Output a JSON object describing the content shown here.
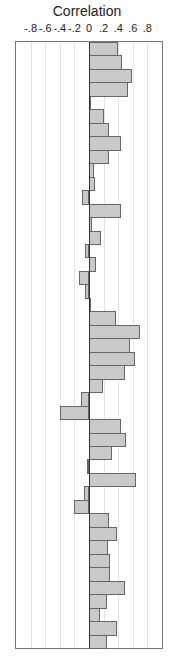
{
  "chart_data": {
    "type": "bar",
    "orientation": "horizontal",
    "title": "Correlation",
    "xlabel": "Correlation",
    "ylabel": "",
    "xlim": [
      -1.0,
      1.0
    ],
    "tick_labels": [
      "-.8",
      "-.6",
      "-.4",
      "-.2",
      "0",
      ".2",
      ".4",
      ".6",
      ".8"
    ],
    "tick_values": [
      -0.8,
      -0.6,
      -0.4,
      -0.2,
      0,
      0.2,
      0.4,
      0.6,
      0.8
    ],
    "grid": true,
    "legend": null,
    "bar_color": "#c9c9c9",
    "bar_edge_color": "#666666",
    "categories": [
      "1",
      "2",
      "3",
      "4",
      "5",
      "6",
      "7",
      "8",
      "9",
      "10",
      "11",
      "12",
      "13",
      "14",
      "15",
      "16",
      "17",
      "18",
      "19",
      "20",
      "21",
      "22",
      "23",
      "24",
      "25",
      "26",
      "27",
      "28",
      "29",
      "30",
      "31",
      "32",
      "33",
      "34",
      "35",
      "36",
      "37",
      "38",
      "39",
      "40",
      "41",
      "42",
      "43",
      "44",
      "45"
    ],
    "values": [
      0.4,
      0.45,
      0.59,
      0.53,
      0.01,
      0.2,
      0.27,
      0.44,
      0.27,
      0.07,
      0.08,
      -0.09,
      0.44,
      0.04,
      0.16,
      -0.05,
      0.09,
      -0.14,
      -0.05,
      0.01,
      0.37,
      0.7,
      0.56,
      0.63,
      0.49,
      0.19,
      -0.11,
      -0.4,
      0.44,
      0.51,
      0.32,
      -0.03,
      0.65,
      -0.07,
      -0.2,
      0.28,
      0.39,
      0.26,
      0.29,
      0.29,
      0.49,
      0.25,
      0.15,
      0.39,
      0.25
    ]
  }
}
